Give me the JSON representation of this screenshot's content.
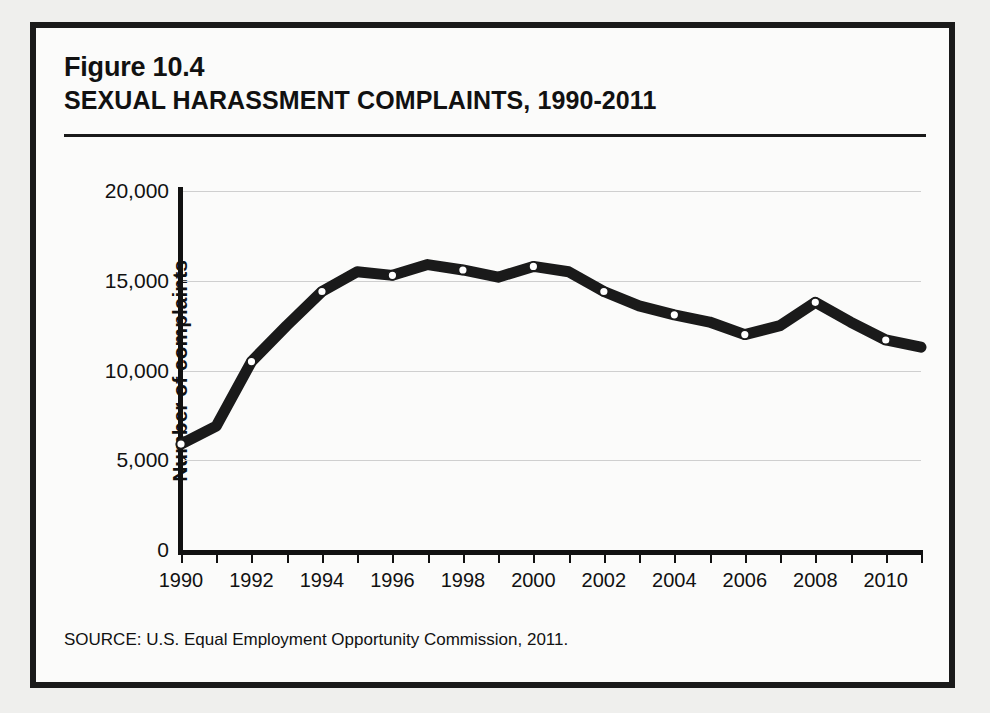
{
  "figure": {
    "number": "Figure 10.4",
    "title": "SEXUAL HARASSMENT COMPLAINTS, 1990-2011",
    "source": "SOURCE: U.S. Equal Employment Opportunity Commission, 2011."
  },
  "colors": {
    "line": "#1a1a1a",
    "marker_fill": "#ffffff",
    "grid": "#cfcfcf",
    "page_background": "#efefed",
    "figure_background": "#fbfbfa",
    "border": "#1a1a1a"
  },
  "chart_data": {
    "type": "line",
    "title": "SEXUAL HARASSMENT COMPLAINTS, 1990-2011",
    "xlabel": "",
    "ylabel": "Number of complaints",
    "xlim": [
      1990,
      2011
    ],
    "ylim": [
      0,
      20000
    ],
    "grid": true,
    "legend": "none",
    "ytick_labels": [
      "20,000",
      "15,000",
      "10,000",
      "5,000",
      "0"
    ],
    "ytick_values": [
      20000,
      15000,
      10000,
      5000,
      0
    ],
    "xtick_labels": [
      "1990",
      "1992",
      "1994",
      "1996",
      "1998",
      "2000",
      "2002",
      "2004",
      "2006",
      "2008",
      "2010"
    ],
    "xtick_values": [
      1990,
      1992,
      1994,
      1996,
      1998,
      2000,
      2002,
      2004,
      2006,
      2008,
      2010
    ],
    "x": [
      1990,
      1991,
      1992,
      1993,
      1994,
      1995,
      1996,
      1997,
      1998,
      1999,
      2000,
      2001,
      2002,
      2003,
      2004,
      2005,
      2006,
      2007,
      2008,
      2009,
      2010,
      2011
    ],
    "values": [
      5900,
      6900,
      10500,
      12500,
      14400,
      15500,
      15300,
      15900,
      15600,
      15200,
      15800,
      15500,
      14400,
      13600,
      13100,
      12700,
      12000,
      12500,
      13800,
      12700,
      11700,
      11300
    ],
    "markers_at": [
      1990,
      1992,
      1994,
      1996,
      1998,
      2000,
      2002,
      2004,
      2006,
      2008,
      2010
    ]
  },
  "bleed_text": [
    "the first six months of 1992 alone, the number of workplace harassment complaints",
    "increased by more than 50 percent (Gross 1992; see, e.g., Figure 10.4, which",
    "harassment complaints filed with the EEOC from 1990 through 2011).",
    "(EEOC 2012).",
    "Despite increased awareness, sociologists have observed that \"the great majority of",
    "women who are abused by behavior that the legal system has so classified as sexual",
    "harassment do not label the experience - do not label their own experience - in that way\"",
    "(Welsh 2000). Halley and others have said, \"Formally, sexual",
    "saying or doing something that others will do not result in ... individual harm\"",
    "or in lost earning potential. Assumes Yet reducing EEOC case complaints to a",
    "theory still holds, whether it that these charges will made be attributed to an",
    "still be visible as a pipeline, and (2) it may be put to use in differentials between employees",
    "women and others on the job (Joshua and Williams 2006).",
    "Most women stay to harass some and must avoid they decline to bring forward their",
    "history to profitable or the business. Previous lawsuits are women had brought the harassers",
    "to a similar matter of the way time, she had been repeatedly cautioned, and discovered",
    "which was resolved, according to more of the contract or 2014 who had pressure hold",
    "when she refused. In the same way, many of those who employ women in hospitality",
    "service sectors are disposed to ... of the practice or ... no one that ... the occupational",
    "harassment that it suffers who had from the institutions. It remains the case that most",
    "victims who experience the most direct physical aggression in the workplace setting"
  ]
}
